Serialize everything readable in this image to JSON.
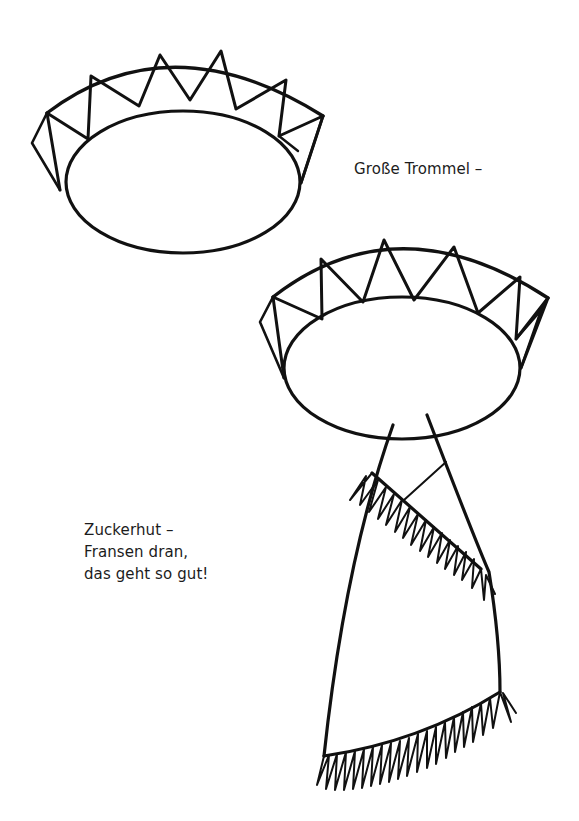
{
  "page": {
    "background": "#ffffff",
    "ink_color": "#111111"
  },
  "captions": {
    "drum": "Große Trommel –",
    "hat": {
      "lines": [
        "Zuckerhut –",
        "Fransen dran,",
        "das geht so gut!"
      ]
    }
  },
  "illustrations": [
    {
      "name": "drum-headband",
      "description": "Paper crown / big drum band with zigzag triangle pattern"
    },
    {
      "name": "hat-with-cone",
      "description": "Zigzag crown band with sugar-loaf cone and fringes"
    }
  ]
}
